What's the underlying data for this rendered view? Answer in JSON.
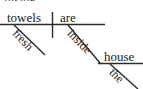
{
  "diagram": {
    "type": "reed-kellogg-sentence-diagram",
    "sentence": "Fresh towels are inside the house.",
    "stroke_color": "#2b2b2b",
    "text_color": "#1a1a1a",
    "background_color": "#ffffff",
    "clipped_text_above": "inside",
    "words": {
      "subject": "towels",
      "verb": "are",
      "subject_modifier": "fresh",
      "preposition": "inside",
      "object_of_preposition": "house",
      "object_modifier": "the"
    },
    "lines": {
      "baseline_label": "main-baseline",
      "subject_verb_divider_label": "subject-verb-divider",
      "fresh_slant_label": "fresh-modifier-slant",
      "inside_slant_label": "inside-preposition-slant",
      "house_baseline_label": "house-baseline",
      "the_slant_label": "the-modifier-slant"
    }
  }
}
